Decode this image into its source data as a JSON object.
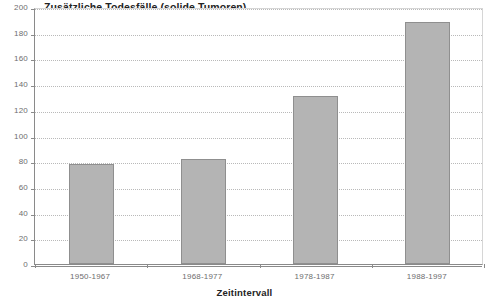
{
  "chart_data": {
    "type": "bar",
    "title": "Zusätzliche Todesfälle (solide Tumoren)",
    "xlabel": "Zeitintervall",
    "ylabel": "",
    "categories": [
      "1950-1967",
      "1968-1977",
      "1978-1987",
      "1988-1997"
    ],
    "values": [
      78,
      82,
      131,
      188
    ],
    "ylim": [
      0,
      200
    ],
    "yticks": [
      0,
      20,
      40,
      60,
      80,
      100,
      120,
      140,
      160,
      180,
      200
    ],
    "ytick_labels": [
      "0",
      "20",
      "40",
      "60",
      "80",
      "100",
      "120",
      "140",
      "160",
      "180",
      "200"
    ],
    "grid": true,
    "grid_style": "dotted-horizontal",
    "legend": false,
    "series": [
      {
        "name": "Zusätzliche Todesfälle (solide Tumoren)",
        "values": [
          78,
          82,
          131,
          188
        ],
        "color": "#b4b4b4",
        "edge_color": "#8f8f8f"
      }
    ]
  },
  "colors": {
    "bar_fill": "#b4b4b4",
    "bar_edge": "#8f8f8f",
    "axis": "#8a8a8a",
    "grid": "#b9b9b9",
    "tick_text": "#6e6e6e",
    "title_text": "#232323",
    "background": "#ffffff"
  }
}
